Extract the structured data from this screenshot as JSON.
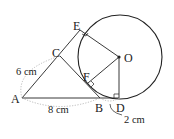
{
  "diagram": {
    "points": {
      "A": "A",
      "B": "B",
      "C": "C",
      "D": "D",
      "E": "E",
      "F": "F",
      "O": "O"
    },
    "measurements": {
      "AC": "6 cm",
      "AB": "8 cm",
      "BD": "2 cm"
    },
    "colors": {
      "line": "#222222",
      "dotted": "#aaaaaa"
    }
  }
}
